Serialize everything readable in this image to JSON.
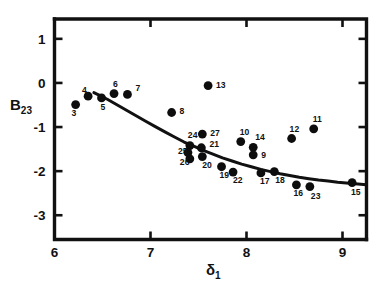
{
  "chart_data": {
    "type": "scatter",
    "title": "",
    "xlabel": "δ₁",
    "ylabel": "B₂₃",
    "xlim": [
      6,
      9.25
    ],
    "ylim": [
      -3.55,
      1.45
    ],
    "xticks": [
      6,
      7,
      8,
      9
    ],
    "xtick_labels": [
      "6",
      "7",
      "8",
      "9"
    ],
    "yticks": [
      1,
      0,
      -1,
      -2,
      -3
    ],
    "ytick_labels": [
      "1",
      "0",
      "-1",
      "-2",
      "-3"
    ],
    "grid": false,
    "legend": "none",
    "point_label_position": "adjacent",
    "points": [
      {
        "label": "3",
        "x": 6.22,
        "y": -0.49,
        "lx": -4,
        "ly": 11
      },
      {
        "label": "4",
        "x": 6.35,
        "y": -0.3,
        "lx": -6,
        "ly": -3
      },
      {
        "label": "5",
        "x": 6.49,
        "y": -0.34,
        "lx": -1,
        "ly": 12
      },
      {
        "label": "6",
        "x": 6.62,
        "y": -0.24,
        "lx": -1,
        "ly": -7
      },
      {
        "label": "7",
        "x": 6.76,
        "y": -0.26,
        "lx": 8,
        "ly": -3
      },
      {
        "label": "8",
        "x": 7.22,
        "y": -0.67,
        "lx": 8,
        "ly": 2
      },
      {
        "label": "13",
        "x": 7.6,
        "y": -0.06,
        "lx": 8,
        "ly": 2
      },
      {
        "label": "27",
        "x": 7.54,
        "y": -1.16,
        "lx": 8,
        "ly": 2
      },
      {
        "label": "24",
        "x": 7.41,
        "y": -1.42,
        "lx": -2,
        "ly": -8
      },
      {
        "label": "25",
        "x": 7.39,
        "y": -1.58,
        "lx": -10,
        "ly": 1
      },
      {
        "label": "21",
        "x": 7.53,
        "y": -1.47,
        "lx": 8,
        "ly": -1
      },
      {
        "label": "26",
        "x": 7.41,
        "y": -1.72,
        "lx": -10,
        "ly": 6
      },
      {
        "label": "20",
        "x": 7.54,
        "y": -1.67,
        "lx": 0,
        "ly": 11
      },
      {
        "label": "19",
        "x": 7.74,
        "y": -1.9,
        "lx": -2,
        "ly": 11
      },
      {
        "label": "10",
        "x": 7.94,
        "y": -1.33,
        "lx": -1,
        "ly": -7
      },
      {
        "label": "14",
        "x": 8.07,
        "y": -1.46,
        "lx": 2,
        "ly": -7
      },
      {
        "label": "9",
        "x": 8.07,
        "y": -1.63,
        "lx": 8,
        "ly": 3
      },
      {
        "label": "22",
        "x": 7.86,
        "y": -2.02,
        "lx": 0,
        "ly": 11
      },
      {
        "label": "17",
        "x": 8.15,
        "y": -2.04,
        "lx": -1,
        "ly": 11
      },
      {
        "label": "18",
        "x": 8.29,
        "y": -2.01,
        "lx": 1,
        "ly": 11
      },
      {
        "label": "12",
        "x": 8.47,
        "y": -1.26,
        "lx": -2,
        "ly": -7
      },
      {
        "label": "11",
        "x": 8.7,
        "y": -1.04,
        "lx": -1,
        "ly": -7
      },
      {
        "label": "16",
        "x": 8.52,
        "y": -2.31,
        "lx": -3,
        "ly": 11
      },
      {
        "label": "23",
        "x": 8.66,
        "y": -2.35,
        "lx": 1,
        "ly": 12
      },
      {
        "label": "15",
        "x": 9.1,
        "y": -2.26,
        "lx": -1,
        "ly": 12
      }
    ],
    "fit_curve": {
      "description": "monotonic decreasing fitted trend line",
      "x": [
        6.41,
        6.55,
        6.75,
        6.95,
        7.15,
        7.35,
        7.55,
        7.75,
        7.95,
        8.15,
        8.35,
        8.55,
        8.75,
        8.95,
        9.25
      ],
      "y": [
        -0.22,
        -0.37,
        -0.62,
        -0.87,
        -1.11,
        -1.34,
        -1.53,
        -1.7,
        -1.84,
        -1.96,
        -2.06,
        -2.14,
        -2.2,
        -2.25,
        -2.31
      ]
    },
    "colors": {
      "marker": "#0d0d0d",
      "curve": "#111111",
      "axis": "#111111",
      "background": "#ffffff"
    }
  }
}
